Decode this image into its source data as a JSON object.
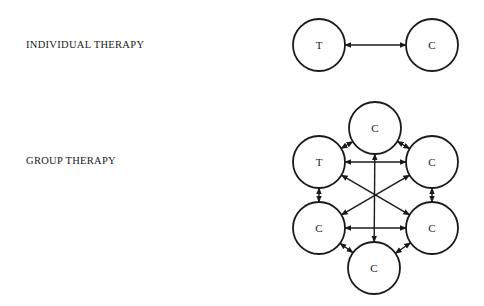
{
  "diagrams": {
    "individual": {
      "label": "INDIVIDUAL THERAPY",
      "nodes": [
        {
          "id": "t",
          "text": "T",
          "cx": 319,
          "cy": 45
        },
        {
          "id": "c",
          "text": "C",
          "cx": 432,
          "cy": 45
        }
      ],
      "edges": [
        [
          "t",
          "c"
        ]
      ]
    },
    "group": {
      "label": "GROUP THERAPY",
      "nodes": [
        {
          "id": "c_top",
          "text": "C",
          "cx": 375,
          "cy": 128
        },
        {
          "id": "t",
          "text": "T",
          "cx": 319,
          "cy": 162
        },
        {
          "id": "c_right_upper",
          "text": "C",
          "cx": 432,
          "cy": 162
        },
        {
          "id": "c_left_lower",
          "text": "C",
          "cx": 319,
          "cy": 228
        },
        {
          "id": "c_right_lower",
          "text": "C",
          "cx": 432,
          "cy": 228
        },
        {
          "id": "c_bottom",
          "text": "C",
          "cx": 374,
          "cy": 268
        }
      ],
      "edges": [
        [
          "t",
          "c_top"
        ],
        [
          "c_top",
          "c_right_upper"
        ],
        [
          "t",
          "c_right_upper"
        ],
        [
          "t",
          "c_left_lower"
        ],
        [
          "c_right_upper",
          "c_right_lower"
        ],
        [
          "c_left_lower",
          "c_right_lower"
        ],
        [
          "c_left_lower",
          "c_bottom"
        ],
        [
          "c_right_lower",
          "c_bottom"
        ],
        [
          "c_top",
          "c_bottom"
        ],
        [
          "t",
          "c_right_lower"
        ],
        [
          "c_right_upper",
          "c_left_lower"
        ]
      ]
    },
    "node_radius": 26,
    "stroke_color": "#1a1a1a"
  }
}
